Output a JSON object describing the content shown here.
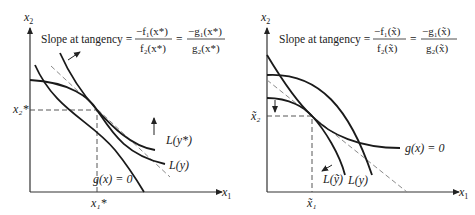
{
  "left_panel": {
    "y_axis_label": "x2",
    "x_axis_label": "x1",
    "slope_label": "Slope at tangency =",
    "frac1_num": "−f₁(x*)",
    "frac1_den": "f₂(x*)",
    "equals": "=",
    "frac2_num": "−g₁(x*)",
    "frac2_den": "g₂(x*)",
    "x2_tick": "x₂*",
    "x1_tick": "x₁*",
    "curve_labels": {
      "L_y_star": "L(y*)",
      "L_y": "L(y)",
      "constraint": "g(x) = 0"
    }
  },
  "right_panel": {
    "y_axis_label": "x2",
    "x_axis_label": "x1",
    "slope_label": "Slope at tangency =",
    "frac1_num": "−f₁(x̃)",
    "frac1_den": "f₂(x̃)",
    "equals": "=",
    "frac2_num": "−g₁(x̃)",
    "frac2_den": "g₂(x̃)",
    "x2_tick": "x̃₂",
    "x1_tick": "x̃₁",
    "curve_labels": {
      "L_y_tilde": "L(ỹ)",
      "L_y": "L(y)",
      "constraint": "g(x) = 0"
    }
  }
}
